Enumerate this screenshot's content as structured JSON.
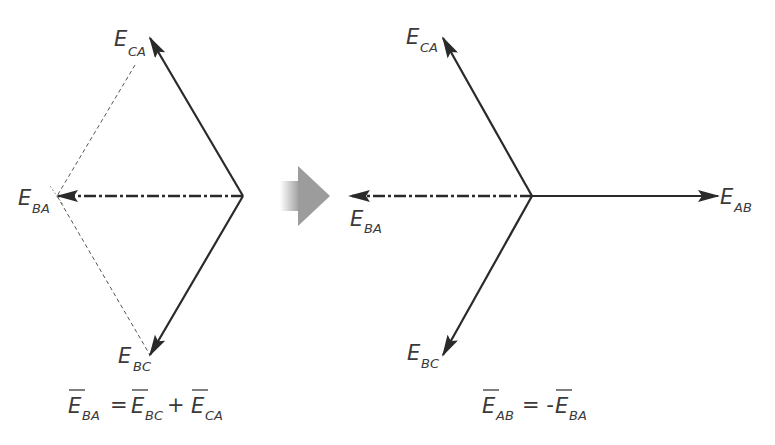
{
  "colors": {
    "ink": "#2a2a2a",
    "label": "#3a3a3a",
    "dashed_construction": "#555555",
    "transition_arrow": "#a0a0a0",
    "background": "#ffffff"
  },
  "left_diagram": {
    "title": "Vector addition (tip-to-tail)",
    "vectors": [
      {
        "id": "E_CA",
        "main": "E",
        "sub": "CA",
        "style": "solid"
      },
      {
        "id": "E_BA",
        "main": "E",
        "sub": "BA",
        "style": "dash-dot"
      },
      {
        "id": "E_BC",
        "main": "E",
        "sub": "BC",
        "style": "solid"
      }
    ],
    "construction_lines": "dashed",
    "equation": {
      "lhs": {
        "main": "E",
        "sub": "BA"
      },
      "op1": "=",
      "term1": {
        "main": "E",
        "sub": "BC"
      },
      "op2": "+",
      "term2": {
        "main": "E",
        "sub": "CA"
      }
    }
  },
  "transition_arrow": {
    "icon": "gradient-right-arrow-icon"
  },
  "right_diagram": {
    "title": "Phasor star",
    "vectors": [
      {
        "id": "E_CA",
        "main": "E",
        "sub": "CA",
        "style": "solid"
      },
      {
        "id": "E_BA",
        "main": "E",
        "sub": "BA",
        "style": "dash-dot"
      },
      {
        "id": "E_BC",
        "main": "E",
        "sub": "BC",
        "style": "solid"
      },
      {
        "id": "E_AB",
        "main": "E",
        "sub": "AB",
        "style": "solid"
      }
    ],
    "equation": {
      "lhs": {
        "main": "E",
        "sub": "AB"
      },
      "op1": "= -",
      "term1": {
        "main": "E",
        "sub": "BA"
      }
    }
  }
}
